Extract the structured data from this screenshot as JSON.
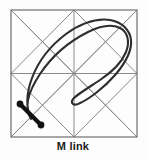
{
  "figure": {
    "caption": "M link",
    "kind": "knot-link-diagram",
    "background_color": "#fdfdfd",
    "frame": {
      "name": "square-frame",
      "color": "#6e6e6e",
      "stroke_width": 1.2,
      "x": 11,
      "y": 10,
      "width": 126,
      "height": 127
    },
    "grid": {
      "name": "grid-lines",
      "color": "#8a8a8a",
      "stroke_width": 1.0,
      "center_x": 74,
      "center_y": 73.5,
      "segments": [
        [
          74,
          10,
          74,
          137
        ],
        [
          11,
          73.5,
          137,
          73.5
        ],
        [
          11,
          10,
          137,
          137
        ],
        [
          137,
          10,
          11,
          137
        ],
        [
          11,
          10,
          74,
          73.5
        ],
        [
          74,
          10,
          11,
          73.5
        ],
        [
          74,
          10,
          137,
          73.5
        ],
        [
          137,
          10,
          74,
          73.5
        ],
        [
          11,
          73.5,
          74,
          137
        ],
        [
          74,
          73.5,
          11,
          137
        ],
        [
          74,
          73.5,
          137,
          137
        ],
        [
          137,
          73.5,
          74,
          137
        ]
      ]
    },
    "link_curve": {
      "name": "m-link-curve",
      "color": "#2e2e2e",
      "stroke_width": 2.1,
      "path": "M 31 119 C 24 108, 28 92, 40 74 C 52 56, 70 41, 88 32 C 100 26, 112 24, 120 28 C 128 32, 130 42, 126 52 C 122 62, 112 72, 100 80 C 88 88, 78 94, 74 98 C 70 102, 72 106, 78 104 C 88 100, 104 88, 116 74 C 126 62, 132 50, 131 40 C 130 30, 122 22, 110 20 C 96 18, 80 24, 66 34 C 50 46, 38 62, 32 78 C 26 94, 26 108, 31 119 Z"
    },
    "thick_segment": {
      "name": "m-link-chord",
      "color": "#111111",
      "stroke_width": 4.2,
      "x1": 20,
      "y1": 104,
      "x2": 41,
      "y2": 125,
      "endpoint_radius": 3.4
    }
  }
}
